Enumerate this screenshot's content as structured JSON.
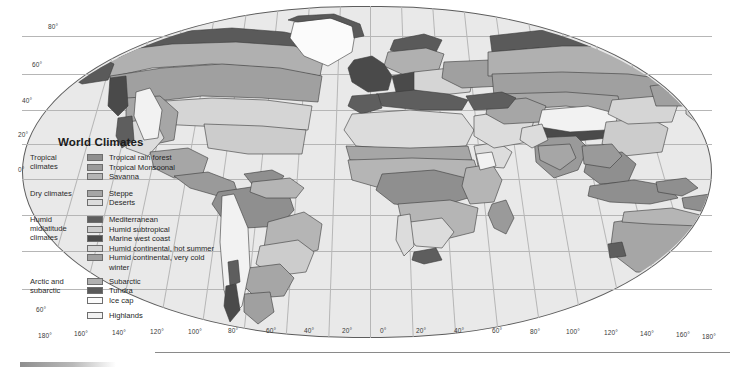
{
  "map": {
    "title": "World Climates",
    "projection_shape": "robinson",
    "background_color": "#e9e9e9",
    "outline_color": "#5d5d5d",
    "graticule_color": "#b6b6b6",
    "latitude_labels": [
      "80°",
      "60°",
      "40°",
      "20°",
      "0°",
      "60°"
    ],
    "longitude_labels": [
      "180°",
      "160°",
      "140°",
      "120°",
      "100°",
      "80°",
      "60°",
      "40°",
      "20°",
      "0°",
      "20°",
      "40°",
      "60°",
      "80°",
      "100°",
      "120°",
      "140°",
      "160°",
      "180°"
    ]
  },
  "legend": {
    "title": "World Climates",
    "groups": [
      {
        "label": "Tropical climates",
        "items": [
          {
            "name": "Tropical rain forest",
            "color": "#8f8f8f"
          },
          {
            "name": "Tropical Monsoonal",
            "color": "#9a9a9a"
          },
          {
            "name": "Savanna",
            "color": "#b5b5b5"
          }
        ]
      },
      {
        "label": "Dry climates",
        "items": [
          {
            "name": "Steppe",
            "color": "#a6a6a6"
          },
          {
            "name": "Deserts",
            "color": "#dcdcdc"
          }
        ]
      },
      {
        "label": "Humid midlatitude climates",
        "items": [
          {
            "name": "Mediterranean",
            "color": "#5e5e5e"
          },
          {
            "name": "Humid subtropical",
            "color": "#cccccc"
          },
          {
            "name": "Marine west coast",
            "color": "#4a4a4a"
          },
          {
            "name": "Humid continental, hot summer",
            "color": "#d5d5d5"
          },
          {
            "name": "Humid continental, very cold",
            "color": "#a0a0a0",
            "continuation": "winter"
          }
        ]
      },
      {
        "label": "Arctic and subarctic",
        "items": [
          {
            "name": "Subarctic",
            "color": "#b0b0b0"
          },
          {
            "name": "Tundra",
            "color": "#5a5a5a"
          },
          {
            "name": "Ice cap",
            "color": "#fbfbfb"
          }
        ]
      },
      {
        "label": "",
        "items": [
          {
            "name": "Highlands",
            "color": "#f2f2f2"
          }
        ]
      }
    ]
  }
}
